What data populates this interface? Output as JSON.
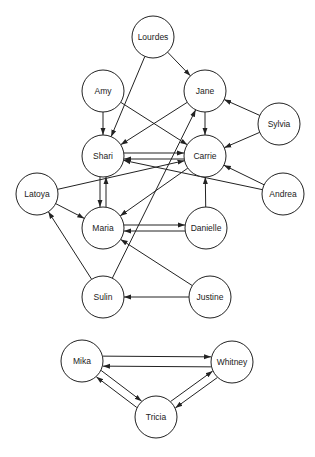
{
  "diagram": {
    "type": "directed-graph",
    "node_radius": 21,
    "nodes": [
      {
        "id": "Lourdes",
        "label": "Lourdes",
        "x": 153,
        "y": 37
      },
      {
        "id": "Amy",
        "label": "Amy",
        "x": 103,
        "y": 91
      },
      {
        "id": "Jane",
        "label": "Jane",
        "x": 205,
        "y": 91
      },
      {
        "id": "Sylvia",
        "label": "Sylvia",
        "x": 279,
        "y": 124
      },
      {
        "id": "Shari",
        "label": "Shari",
        "x": 103,
        "y": 156
      },
      {
        "id": "Carrie",
        "label": "Carrie",
        "x": 205,
        "y": 156
      },
      {
        "id": "Latoya",
        "label": "Latoya",
        "x": 37,
        "y": 194
      },
      {
        "id": "Andrea",
        "label": "Andrea",
        "x": 283,
        "y": 194
      },
      {
        "id": "Maria",
        "label": "Maria",
        "x": 103,
        "y": 228
      },
      {
        "id": "Danielle",
        "label": "Danielle",
        "x": 206,
        "y": 228
      },
      {
        "id": "Sulin",
        "label": "Sulin",
        "x": 103,
        "y": 297
      },
      {
        "id": "Justine",
        "label": "Justine",
        "x": 210,
        "y": 297
      },
      {
        "id": "Mika",
        "label": "Mika",
        "x": 82,
        "y": 361
      },
      {
        "id": "Whitney",
        "label": "Whitney",
        "x": 232,
        "y": 362
      },
      {
        "id": "Tricia",
        "label": "Tricia",
        "x": 156,
        "y": 417
      }
    ],
    "edges": [
      {
        "from": "Lourdes",
        "to": "Jane"
      },
      {
        "from": "Lourdes",
        "to": "Shari"
      },
      {
        "from": "Amy",
        "to": "Shari"
      },
      {
        "from": "Amy",
        "to": "Carrie"
      },
      {
        "from": "Jane",
        "to": "Shari"
      },
      {
        "from": "Jane",
        "to": "Carrie"
      },
      {
        "from": "Sylvia",
        "to": "Jane"
      },
      {
        "from": "Sylvia",
        "to": "Carrie"
      },
      {
        "from": "Shari",
        "to": "Carrie",
        "offset": -3
      },
      {
        "from": "Carrie",
        "to": "Shari",
        "offset": -3
      },
      {
        "from": "Latoya",
        "to": "Carrie"
      },
      {
        "from": "Andrea",
        "to": "Shari"
      },
      {
        "from": "Andrea",
        "to": "Carrie"
      },
      {
        "from": "Carrie",
        "to": "Maria"
      },
      {
        "from": "Shari",
        "to": "Maria",
        "offset": 3
      },
      {
        "from": "Maria",
        "to": "Shari",
        "offset": 3
      },
      {
        "from": "Latoya",
        "to": "Maria"
      },
      {
        "from": "Maria",
        "to": "Danielle",
        "offset": -3
      },
      {
        "from": "Danielle",
        "to": "Maria",
        "offset": -3
      },
      {
        "from": "Danielle",
        "to": "Carrie"
      },
      {
        "from": "Sulin",
        "to": "Latoya"
      },
      {
        "from": "Sulin",
        "to": "Jane"
      },
      {
        "from": "Justine",
        "to": "Maria"
      },
      {
        "from": "Justine",
        "to": "Sulin"
      },
      {
        "from": "Whitney",
        "to": "Mika",
        "offset": -5
      },
      {
        "from": "Mika",
        "to": "Whitney",
        "offset": -5
      },
      {
        "from": "Mika",
        "to": "Tricia",
        "offset": -4
      },
      {
        "from": "Tricia",
        "to": "Mika",
        "offset": -4
      },
      {
        "from": "Tricia",
        "to": "Whitney",
        "offset": -4
      },
      {
        "from": "Whitney",
        "to": "Tricia",
        "offset": -4
      }
    ]
  }
}
